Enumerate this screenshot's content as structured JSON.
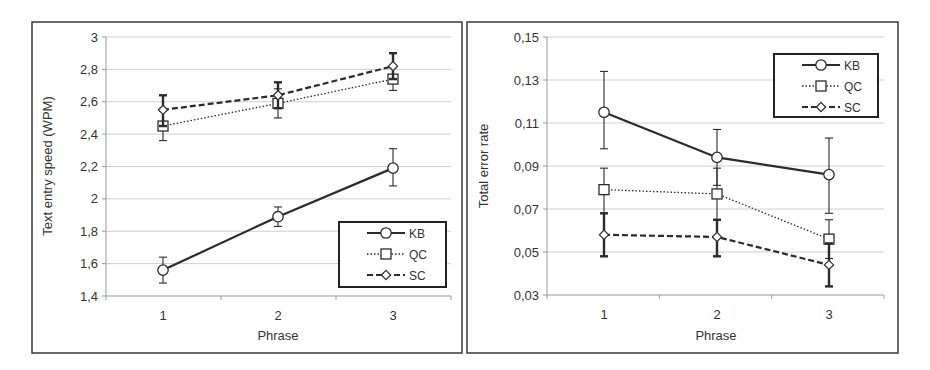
{
  "chart_data": [
    {
      "type": "line",
      "title": "",
      "xlabel": "Phrase",
      "ylabel": "Text entry speed (WPM)",
      "categories": [
        "1",
        "2",
        "3"
      ],
      "ylim": [
        1.4,
        3.0
      ],
      "yticks": [
        1.4,
        1.6,
        1.8,
        2.0,
        2.2,
        2.4,
        2.6,
        2.8,
        3.0
      ],
      "ytick_labels": [
        "1,4",
        "1,6",
        "1,8",
        "2",
        "2,2",
        "2,4",
        "2,6",
        "2,8",
        "3"
      ],
      "grid": true,
      "legend_position": "lower right",
      "series": [
        {
          "name": "KB",
          "style": "solid",
          "marker": "circle",
          "values": [
            1.56,
            1.89,
            2.19
          ],
          "err_low": [
            1.48,
            1.83,
            2.08
          ],
          "err_high": [
            1.64,
            1.95,
            2.31
          ]
        },
        {
          "name": "QC",
          "style": "dotted",
          "marker": "square",
          "values": [
            2.45,
            2.59,
            2.74
          ],
          "err_low": [
            2.36,
            2.5,
            2.67
          ],
          "err_high": [
            2.54,
            2.68,
            2.81
          ]
        },
        {
          "name": "SC",
          "style": "dashed",
          "marker": "diamond",
          "values": [
            2.55,
            2.64,
            2.82
          ],
          "err_low": [
            2.45,
            2.56,
            2.74
          ],
          "err_high": [
            2.64,
            2.72,
            2.9
          ]
        }
      ]
    },
    {
      "type": "line",
      "title": "",
      "xlabel": "Phrase",
      "ylabel": "Total error rate",
      "categories": [
        "1",
        "2",
        "3"
      ],
      "ylim": [
        0.03,
        0.15
      ],
      "yticks": [
        0.03,
        0.05,
        0.07,
        0.09,
        0.11,
        0.13,
        0.15
      ],
      "ytick_labels": [
        "0,03",
        "0,05",
        "0,07",
        "0,09",
        "0,11",
        "0,13",
        "0,15"
      ],
      "grid": true,
      "legend_position": "upper right",
      "series": [
        {
          "name": "KB",
          "style": "solid",
          "marker": "circle",
          "values": [
            0.115,
            0.094,
            0.086
          ],
          "err_low": [
            0.098,
            0.081,
            0.068
          ],
          "err_high": [
            0.134,
            0.107,
            0.103
          ]
        },
        {
          "name": "QC",
          "style": "dotted",
          "marker": "square",
          "values": [
            0.079,
            0.077,
            0.056
          ],
          "err_low": [
            0.068,
            0.065,
            0.047
          ],
          "err_high": [
            0.089,
            0.089,
            0.065
          ]
        },
        {
          "name": "SC",
          "style": "dashed",
          "marker": "diamond",
          "values": [
            0.058,
            0.057,
            0.044
          ],
          "err_low": [
            0.048,
            0.048,
            0.034
          ],
          "err_high": [
            0.068,
            0.065,
            0.054
          ]
        }
      ]
    }
  ],
  "colors": {
    "line": "#2b2b2b",
    "grid": "#cfcfcf",
    "frame": "#3a3a3a",
    "text": "#333333"
  }
}
